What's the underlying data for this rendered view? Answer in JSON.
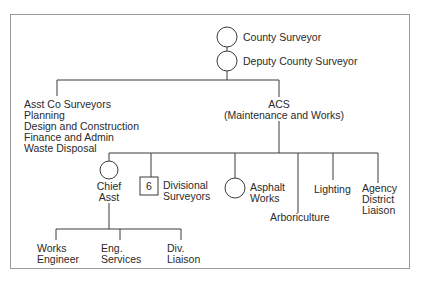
{
  "page": {
    "number_fragment": "1.5.7"
  },
  "nodes": {
    "county_surveyor": "County Surveyor",
    "deputy": "Deputy County Surveyor",
    "asst_list": [
      "Asst Co Surveyors",
      "Planning",
      "Design and Construction",
      "Finance and Admin",
      "Waste Disposal"
    ],
    "acs": [
      "ACS",
      "(Maintenance and Works)"
    ],
    "chief_asst": [
      "Chief",
      "Asst"
    ],
    "divisional_count": "6",
    "divisional": [
      "Divisional",
      "Surveyors"
    ],
    "asphalt": [
      "Asphalt",
      "Works"
    ],
    "arboriculture": "Arboriculture",
    "lighting": "Lighting",
    "agency": [
      "Agency",
      "District",
      "Liaison"
    ],
    "works_engineer": [
      "Works",
      "Engineer"
    ],
    "eng_services": [
      "Eng.",
      "Services"
    ],
    "div_liaison": [
      "Div.",
      "Liaison"
    ]
  },
  "colors": {
    "line": "#3a3a3a",
    "frame": "#9a9a9a",
    "text": "#2a2a2a"
  }
}
